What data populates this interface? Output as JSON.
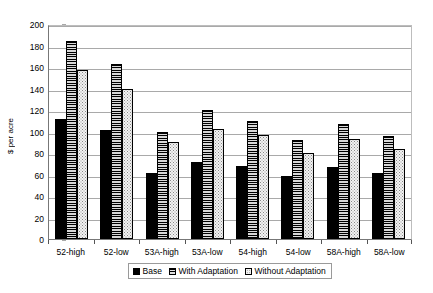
{
  "chart_data": {
    "type": "bar",
    "title": "",
    "xlabel": "",
    "ylabel": "$ per acre",
    "ylim": [
      0,
      200
    ],
    "yticks": [
      0,
      20,
      40,
      60,
      80,
      100,
      120,
      140,
      160,
      180,
      200
    ],
    "grid": true,
    "legend_position": "bottom",
    "categories": [
      "52-high",
      "52-low",
      "53A-high",
      "53A-low",
      "54-high",
      "54-low",
      "58A-high",
      "58A-low"
    ],
    "series": [
      {
        "name": "Base",
        "pattern": "solid-black",
        "color": "#000000",
        "values": [
          112,
          101,
          61,
          72,
          68,
          59,
          67,
          61
        ]
      },
      {
        "name": "With Adaptation",
        "pattern": "horizontal-stripes",
        "color": "#808080",
        "values": [
          184,
          163,
          100,
          120,
          110,
          92,
          107,
          96
        ]
      },
      {
        "name": "Without Adaptation",
        "pattern": "dotted",
        "color": "#f2f2f2",
        "values": [
          157,
          140,
          90,
          102,
          97,
          80,
          93,
          84
        ]
      }
    ]
  },
  "axis": {
    "y_title": "$ per acre",
    "y_labels": [
      "200",
      "180",
      "160",
      "140",
      "120",
      "100",
      "80",
      "60",
      "40",
      "20",
      "0"
    ]
  },
  "legend": {
    "items": [
      {
        "label": "Base"
      },
      {
        "label": "With Adaptation"
      },
      {
        "label": "Without Adaptation"
      }
    ]
  }
}
